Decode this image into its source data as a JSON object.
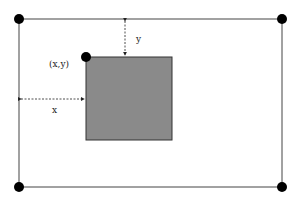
{
  "diagram": {
    "outer_rect": {
      "x1": 19,
      "y1": 19,
      "x2": 282,
      "y2": 187,
      "stroke": "#444444"
    },
    "inner_rect": {
      "x": 86,
      "y": 57,
      "width": 86,
      "height": 83,
      "fill": "#8a8a8a",
      "stroke": "#333333"
    },
    "corner_dots": [
      {
        "cx": 19,
        "cy": 19
      },
      {
        "cx": 282,
        "cy": 19
      },
      {
        "cx": 19,
        "cy": 187
      },
      {
        "cx": 282,
        "cy": 187
      },
      {
        "cx": 86,
        "cy": 57
      }
    ],
    "labels": {
      "origin": "(x,y)",
      "x_offset": "x",
      "y_offset": "y"
    }
  }
}
